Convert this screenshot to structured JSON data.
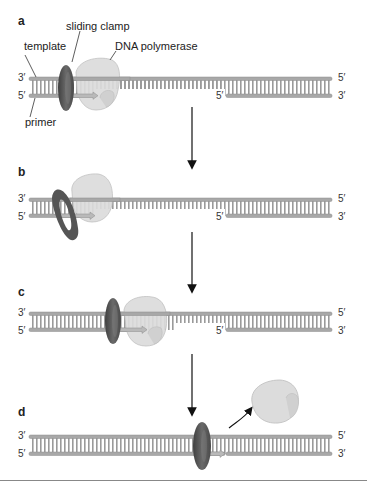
{
  "figure": {
    "colors": {
      "strand": "#a8a8a8",
      "strand_edge": "#8c8c8c",
      "rungs": "#9a9a9a",
      "clamp": "#5f5f5f",
      "clamp_dark": "#444444",
      "polymerase": "#dcdcdc",
      "polymerase_edge": "#bdbdbd",
      "new_strand": "#b9b9b9",
      "arrow": "#111111"
    }
  },
  "labels": {
    "template": "template",
    "sliding_clamp": "sliding clamp",
    "dna_polymerase": "DNA polymerase",
    "primer": "primer"
  },
  "panels": [
    {
      "id": "a",
      "label": "a",
      "top_left": "3′",
      "bottom_left": "5′",
      "top_right": "5′",
      "bottom_right": "3′",
      "downstream_5": "5′"
    },
    {
      "id": "b",
      "label": "b",
      "top_left": "3′",
      "bottom_left": "5′",
      "top_right": "5′",
      "bottom_right": "3′",
      "downstream_5": "5′"
    },
    {
      "id": "c",
      "label": "c",
      "top_left": "3′",
      "bottom_left": "5′",
      "top_right": "5′",
      "bottom_right": "3′",
      "downstream_5": "5′"
    },
    {
      "id": "d",
      "label": "d",
      "top_left": "3′",
      "bottom_left": "5′",
      "top_right": "5′",
      "bottom_right": "3′"
    }
  ]
}
